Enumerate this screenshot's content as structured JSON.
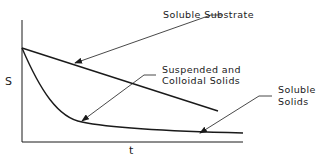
{
  "diagram": {
    "axes": {
      "y_label": "S",
      "x_label": "t"
    },
    "curves": [
      {
        "name": "Soluble Substrate",
        "shape": "linear decrease"
      },
      {
        "name": "Suspended and Colloidal Solids",
        "shape": "exponential decay"
      },
      {
        "name": "Soluble Solids",
        "shape": "near-constant low asymptote"
      }
    ],
    "labels": {
      "soluble_substrate": "Soluble Substrate",
      "suspended_line1": "Suspended and",
      "suspended_line2": "Colloidal Solids",
      "soluble_solids_line1": "Soluble",
      "soluble_solids_line2": "Solids"
    },
    "colors": {
      "line": "#1a1a1a",
      "background": "#ffffff"
    }
  }
}
